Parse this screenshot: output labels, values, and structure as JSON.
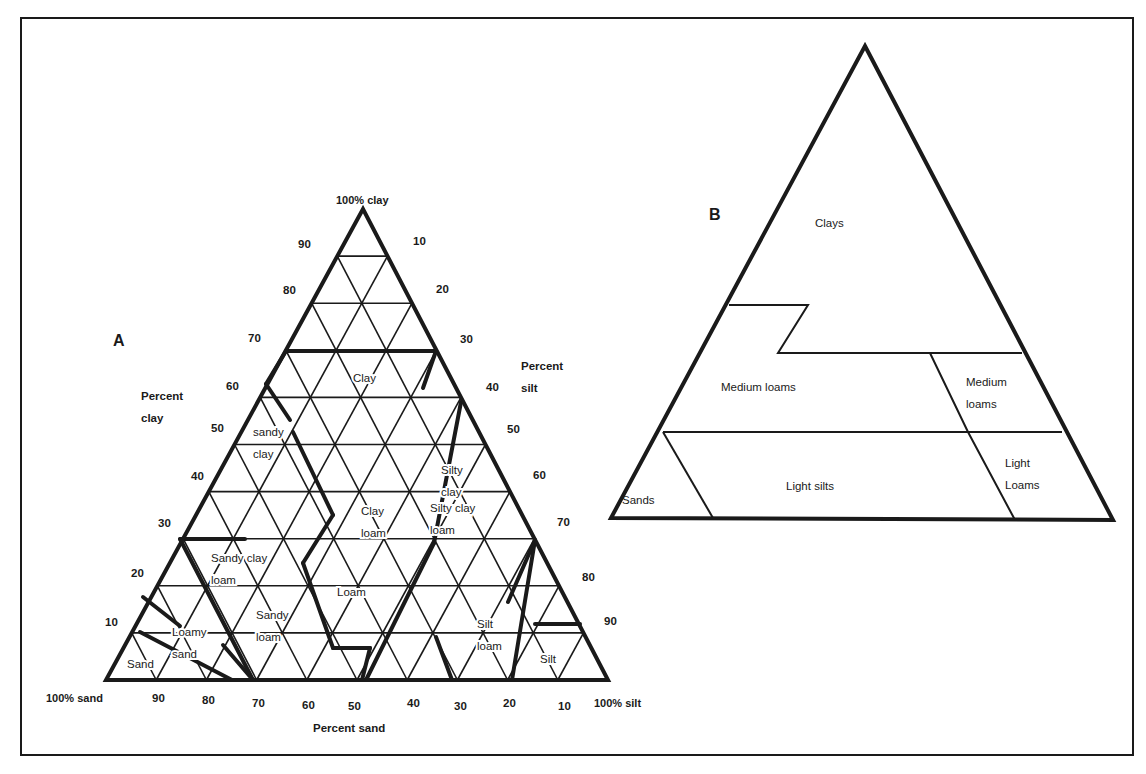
{
  "figure": {
    "frame": {
      "x": 20,
      "y": 17,
      "w": 1114,
      "h": 739
    },
    "colors": {
      "ink": "#1a1a1a",
      "background": "#ffffff"
    }
  },
  "panel_a": {
    "panel_label": "A",
    "panel_label_pos": [
      113,
      346
    ],
    "vertices": {
      "sand": [
        106,
        680
      ],
      "silt": [
        608,
        680
      ],
      "clay": [
        363,
        209
      ]
    },
    "corner_labels": {
      "clay": {
        "text": "100% clay",
        "pos": [
          336,
          204
        ]
      },
      "sand": {
        "text": "100% sand",
        "pos": [
          46,
          702
        ]
      },
      "silt": {
        "text": "100% silt",
        "pos": [
          594,
          707
        ]
      }
    },
    "axis_titles": {
      "clay": {
        "lines": [
          "Percent",
          "clay"
        ],
        "pos": [
          141,
          400
        ]
      },
      "silt": {
        "lines": [
          "Percent",
          "silt"
        ],
        "pos": [
          521,
          370
        ]
      },
      "sand": {
        "lines": [
          "Percent sand"
        ],
        "pos": [
          313,
          732
        ]
      }
    },
    "clay_ticks": [
      {
        "text": "90",
        "pos": [
          298,
          248
        ]
      },
      {
        "text": "80",
        "pos": [
          283,
          294
        ]
      },
      {
        "text": "70",
        "pos": [
          248,
          342
        ]
      },
      {
        "text": "60",
        "pos": [
          226,
          390
        ]
      },
      {
        "text": "50",
        "pos": [
          211,
          432
        ]
      },
      {
        "text": "40",
        "pos": [
          191,
          480
        ]
      },
      {
        "text": "30",
        "pos": [
          158,
          527
        ]
      },
      {
        "text": "20",
        "pos": [
          131,
          577
        ]
      },
      {
        "text": "10",
        "pos": [
          105,
          626
        ]
      }
    ],
    "silt_ticks": [
      {
        "text": "10",
        "pos": [
          413,
          245
        ]
      },
      {
        "text": "20",
        "pos": [
          436,
          293
        ]
      },
      {
        "text": "30",
        "pos": [
          460,
          343
        ]
      },
      {
        "text": "40",
        "pos": [
          486,
          391
        ]
      },
      {
        "text": "50",
        "pos": [
          507,
          433
        ]
      },
      {
        "text": "60",
        "pos": [
          533,
          479
        ]
      },
      {
        "text": "70",
        "pos": [
          557,
          526
        ]
      },
      {
        "text": "80",
        "pos": [
          582,
          581
        ]
      },
      {
        "text": "90",
        "pos": [
          604,
          625
        ]
      }
    ],
    "sand_ticks": [
      {
        "text": "90",
        "pos": [
          152,
          702
        ]
      },
      {
        "text": "80",
        "pos": [
          202,
          704
        ]
      },
      {
        "text": "70",
        "pos": [
          252,
          707
        ]
      },
      {
        "text": "60",
        "pos": [
          302,
          709
        ]
      },
      {
        "text": "50",
        "pos": [
          348,
          710
        ]
      },
      {
        "text": "40",
        "pos": [
          407,
          707
        ]
      },
      {
        "text": "30",
        "pos": [
          454,
          710
        ]
      },
      {
        "text": "20",
        "pos": [
          503,
          707
        ]
      },
      {
        "text": "10",
        "pos": [
          558,
          710
        ]
      }
    ],
    "texture_classes": [
      {
        "name": "Clay",
        "lines": [
          "Clay"
        ],
        "pos": [
          353,
          382
        ]
      },
      {
        "name": "Sandy clay",
        "lines": [
          "sandy",
          "clay"
        ],
        "pos": [
          253,
          436
        ]
      },
      {
        "name": "Silty clay",
        "lines": [
          "Silty",
          "clay"
        ],
        "pos": [
          441,
          474
        ]
      },
      {
        "name": "Clay loam",
        "lines": [
          "Clay",
          "loam"
        ],
        "pos": [
          361,
          515
        ]
      },
      {
        "name": "Silty clay loam",
        "lines": [
          "Silty clay",
          "loam"
        ],
        "pos": [
          430,
          512
        ]
      },
      {
        "name": "Sandy clay loam",
        "lines": [
          "Sandy clay",
          "loam"
        ],
        "pos": [
          211,
          562
        ]
      },
      {
        "name": "Loam",
        "lines": [
          "Loam"
        ],
        "pos": [
          337,
          596
        ]
      },
      {
        "name": "Sandy loam",
        "lines": [
          "Sandy",
          "loam"
        ],
        "pos": [
          256,
          619
        ]
      },
      {
        "name": "Silt loam",
        "lines": [
          "Silt",
          "loam"
        ],
        "pos": [
          477,
          628
        ]
      },
      {
        "name": "Loamy sand",
        "lines": [
          "Loamy",
          "sand"
        ],
        "pos": [
          172,
          636
        ]
      },
      {
        "name": "Sand",
        "lines": [
          "Sand"
        ],
        "pos": [
          127,
          668
        ]
      },
      {
        "name": "Silt",
        "lines": [
          "Silt",
          ""
        ],
        "pos": [
          540,
          663
        ]
      }
    ],
    "boundaries": [
      [
        [
          286,
          351
        ],
        [
          436,
          351
        ]
      ],
      [
        [
          436,
          351
        ],
        [
          423,
          388
        ]
      ],
      [
        [
          286,
          351
        ],
        [
          266,
          384
        ]
      ],
      [
        [
          266,
          384
        ],
        [
          290,
          420
        ]
      ],
      [
        [
          293,
          432
        ],
        [
          333,
          515
        ]
      ],
      [
        [
          333,
          515
        ],
        [
          303,
          563
        ]
      ],
      [
        [
          303,
          563
        ],
        [
          333,
          648
        ]
      ],
      [
        [
          333,
          648
        ],
        [
          370,
          648
        ]
      ],
      [
        [
          370,
          648
        ],
        [
          362,
          680
        ]
      ],
      [
        [
          461,
          402
        ],
        [
          434,
          543
        ]
      ],
      [
        [
          434,
          543
        ],
        [
          366,
          680
        ]
      ],
      [
        [
          180,
          539
        ],
        [
          245,
          539
        ]
      ],
      [
        [
          180,
          539
        ],
        [
          253,
          680
        ]
      ],
      [
        [
          535,
          540
        ],
        [
          508,
          602
        ]
      ],
      [
        [
          535,
          540
        ],
        [
          512,
          680
        ]
      ],
      [
        [
          535,
          624
        ],
        [
          580,
          624
        ]
      ],
      [
        [
          143,
          597
        ],
        [
          180,
          626
        ]
      ],
      [
        [
          140,
          632
        ],
        [
          232,
          680
        ]
      ],
      [
        [
          223,
          645
        ],
        [
          253,
          680
        ]
      ],
      [
        [
          436,
          637
        ],
        [
          452,
          680
        ]
      ]
    ]
  },
  "panel_b": {
    "panel_label": "B",
    "panel_label_pos": [
      709,
      220
    ],
    "outline": [
      [
        865,
        46
      ],
      [
        1113,
        520
      ],
      [
        611,
        518
      ]
    ],
    "dividers": [
      [
        [
          729,
          305
        ],
        [
          808,
          305
        ],
        [
          778,
          353
        ],
        [
          1022,
          353
        ]
      ],
      [
        [
          930,
          353
        ],
        [
          968,
          432
        ],
        [
          1015,
          520
        ]
      ],
      [
        [
          663,
          432
        ],
        [
          1062,
          432
        ]
      ],
      [
        [
          663,
          432
        ],
        [
          713,
          518
        ]
      ]
    ],
    "regions": [
      {
        "name": "Clays",
        "lines": [
          "Clays"
        ],
        "pos": [
          815,
          227
        ]
      },
      {
        "name": "Medium loams (left)",
        "lines": [
          "Medium loams"
        ],
        "pos": [
          721,
          391
        ]
      },
      {
        "name": "Medium loams (right)",
        "lines": [
          "Medium",
          "loams"
        ],
        "pos": [
          966,
          386
        ]
      },
      {
        "name": "Sands",
        "lines": [
          "Sands"
        ],
        "pos": [
          622,
          504
        ]
      },
      {
        "name": "Light silts",
        "lines": [
          "Light silts"
        ],
        "pos": [
          786,
          490
        ]
      },
      {
        "name": "Light Loams",
        "lines": [
          "Light",
          "Loams"
        ],
        "pos": [
          1005,
          467
        ]
      }
    ]
  }
}
